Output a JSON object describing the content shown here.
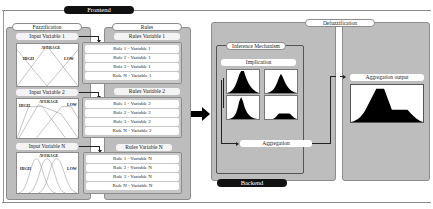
{
  "frontend": {
    "label": "Frontend"
  },
  "backend": {
    "label": "Backend"
  },
  "fuzzification": {
    "title": "Fuzzification",
    "inputs": [
      {
        "label": "Input Variable 1",
        "mf_labels": {
          "left": "HIGH",
          "center": "AVERAGE",
          "right": "LOW"
        },
        "shape": "triangular"
      },
      {
        "label": "Input Variable 2",
        "mf_labels": {
          "left": "HIGH",
          "center": "AVERAGE",
          "right": "LOW"
        },
        "shape": "trapezoidal"
      },
      {
        "label": "Input Variable N",
        "mf_labels": {
          "left": "HIGH",
          "center": "AVERAGE",
          "right": "LOW"
        },
        "shape": "gaussian"
      }
    ]
  },
  "rules": {
    "title": "Rules",
    "groups": [
      {
        "label": "Rules Variable 1",
        "items": [
          "Rule 1 - Variable 1",
          "Rule 2 - Variable 1",
          "Rule 3 - Variable 1",
          "Rule N - Variable 1"
        ]
      },
      {
        "label": "Rules Variable 2",
        "items": [
          "Rule 1 - Variable 2",
          "Rule 2 - Variable 2",
          "Rule 3 - Variable 2",
          "Rule N - Variable 2"
        ]
      },
      {
        "label": "Rules Variable N",
        "items": [
          "Rule 1 - Variable N",
          "Rule 2 - Variable N",
          "Rule 3 - Variable N",
          "Rule N - Variable N"
        ]
      }
    ]
  },
  "defuzzification": {
    "title": "Defuzzification"
  },
  "inference": {
    "title": "Inference Mechanism",
    "implication_label": "Implication",
    "aggregation_label": "Aggregation"
  },
  "aggregation_output": {
    "label": "Aggregation output"
  },
  "colors": {
    "panel": "#bdbdbd",
    "dark_pill": "#111111",
    "fill_black": "#000000"
  }
}
